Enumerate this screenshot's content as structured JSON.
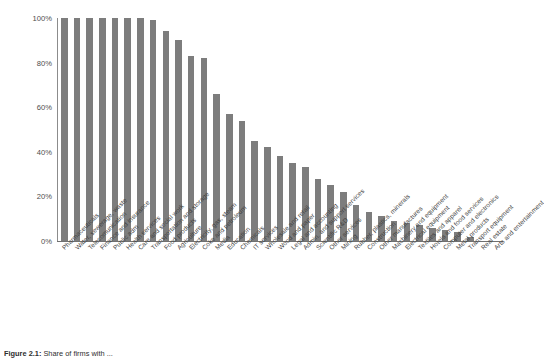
{
  "chart_data": {
    "type": "bar",
    "title": "",
    "xlabel": "",
    "ylabel": "",
    "ylim": [
      0,
      100
    ],
    "ytick_labels": [
      "100%",
      "80%",
      "60%",
      "40%",
      "20%",
      "0%"
    ],
    "ytick_values": [
      100,
      80,
      60,
      40,
      20,
      0
    ],
    "grid": false,
    "legend": "none",
    "bar_color": "#7d7d7d",
    "categories": [
      "Pharmaceuticals",
      "Water, sewerage, waste",
      "Telecomunication",
      "Finance and insurance",
      "Public adm",
      "Health services",
      "Care and social work",
      "Transportation and storage",
      "Food products",
      "Agriculture",
      "Electricity, gas, steam",
      "Coke and petroleum",
      "Media",
      "Education",
      "Chemicals",
      "IT services",
      "Wholesale and retail",
      "Wood and paper",
      "Legal and accounting",
      "Admin. and support services",
      "Scientific R&D",
      "Other services",
      "Mining",
      "Rubber, plastics, minerals",
      "Construction",
      "Other manufactures",
      "Machinery and equipment",
      "Electrical equipment",
      "Textiles and apparel",
      "Hotels and food services",
      "Computer and electronics",
      "Metal products",
      "Transport equipment",
      "Real estate",
      "Arts and entertainment"
    ],
    "values": [
      100,
      100,
      100,
      100,
      100,
      100,
      100,
      99,
      94,
      90,
      83,
      82,
      66,
      57,
      54,
      45,
      42,
      38,
      35,
      33,
      28,
      25,
      22,
      16,
      13,
      11,
      9,
      8,
      7,
      6,
      5,
      4,
      2,
      0,
      0
    ]
  },
  "caption": {
    "label": "Figure 2.1:",
    "text": "Share of firms with ..."
  }
}
